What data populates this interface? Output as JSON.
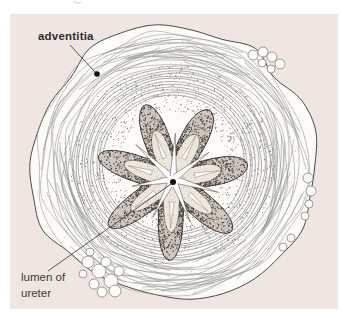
{
  "figure": {
    "panel_color": "#efe6e2",
    "paper_color": "#fdfbf7",
    "ink_color": "#4a4a4a",
    "ring_color": "#9a9a9a",
    "muscle_ring_color": "#6e6e6e",
    "muscle_stipple_color": "#7b7b7b",
    "epithelium_color": "#45403a",
    "epithelium_band_fill": "#cfc8c0",
    "fold_core_fill": "#ece6dd",
    "lumen_color": "#ffffff",
    "labels": {
      "adventitia": "adventitia",
      "lumen_line1": "lumen of",
      "lumen_line2": "ureter"
    }
  }
}
